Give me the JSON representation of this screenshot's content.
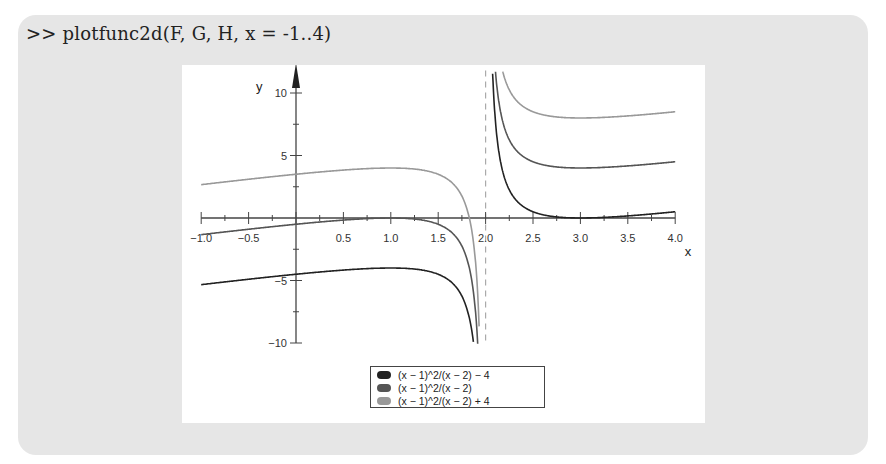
{
  "command": ">> plotfunc2d(F, G, H, x = -1..4)",
  "colors": {
    "panel_bg": "#e6e6e6",
    "plot_bg": "#ffffff",
    "axis": "#444444",
    "series": [
      "#222222",
      "#555555",
      "#999999"
    ],
    "asymptote": "#aaaaaa"
  },
  "legend": {
    "items": [
      {
        "label": "(x − 1)^2/(x − 2) − 4",
        "color": "#222222"
      },
      {
        "label": "(x − 1)^2/(x − 2)",
        "color": "#555555"
      },
      {
        "label": "(x − 1)^2/(x − 2) + 4",
        "color": "#999999"
      }
    ]
  },
  "chart_data": {
    "type": "line",
    "title": "",
    "xlabel": "x",
    "ylabel": "y",
    "xlim": [
      -1.0,
      4.0
    ],
    "ylim": [
      -10,
      10
    ],
    "x_ticks": [
      "-1.0",
      "-0.5",
      "0.5",
      "1.0",
      "1.5",
      "2.0",
      "2.5",
      "3.0",
      "3.5",
      "4.0"
    ],
    "y_ticks": [
      "10",
      "5",
      "-5",
      "-10"
    ],
    "grid": false,
    "vertical_asymptote": 2.0,
    "legend_position": "bottom-center",
    "series": [
      {
        "name": "(x − 1)^2/(x − 2) − 4",
        "offset": -4,
        "x": [
          -1.0,
          -0.5,
          0.0,
          0.5,
          1.0,
          1.5,
          1.8,
          1.9,
          2.1,
          2.2,
          2.5,
          3.0,
          3.5,
          4.0
        ],
        "y": [
          -5.33,
          -4.9,
          -4.5,
          -4.17,
          -4.0,
          -4.5,
          -7.2,
          -12.1,
          8.1,
          3.2,
          0.5,
          0.0,
          0.17,
          0.5
        ]
      },
      {
        "name": "(x − 1)^2/(x − 2)",
        "offset": 0,
        "x": [
          -1.0,
          -0.5,
          0.0,
          0.5,
          1.0,
          1.5,
          1.8,
          1.9,
          2.1,
          2.2,
          2.5,
          3.0,
          3.5,
          4.0
        ],
        "y": [
          -1.33,
          -0.9,
          -0.5,
          -0.17,
          0.0,
          -0.5,
          -3.2,
          -8.1,
          12.1,
          7.2,
          4.5,
          4.0,
          4.17,
          4.5
        ]
      },
      {
        "name": "(x − 1)^2/(x − 2) + 4",
        "offset": 4,
        "x": [
          -1.0,
          -0.5,
          0.0,
          0.5,
          1.0,
          1.5,
          1.8,
          1.9,
          2.1,
          2.2,
          2.5,
          3.0,
          3.5,
          4.0
        ],
        "y": [
          2.67,
          3.1,
          3.5,
          3.83,
          4.0,
          3.5,
          0.8,
          -4.1,
          16.1,
          11.2,
          8.5,
          8.0,
          8.17,
          8.5
        ]
      }
    ]
  }
}
